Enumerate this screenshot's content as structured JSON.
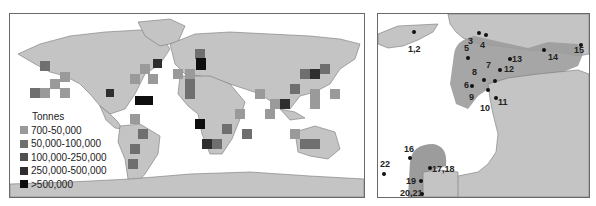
{
  "figure": {
    "left_panel": {
      "name": "world-map",
      "legend": {
        "title": "Tonnes",
        "items": [
          {
            "label": "700-50,000",
            "color": "#9a9a9a"
          },
          {
            "label": "50,000-100,000",
            "color": "#6f6f6f"
          },
          {
            "label": "100,000-250,000",
            "color": "#505050"
          },
          {
            "label": "250,000-500,000",
            "color": "#2e2e2e"
          },
          {
            "label": ">500,000",
            "color": "#0e0e0e"
          }
        ]
      }
    },
    "right_panel": {
      "name": "western-europe-map",
      "sites": [
        {
          "label": "1,2"
        },
        {
          "label": "3"
        },
        {
          "label": "4"
        },
        {
          "label": "5"
        },
        {
          "label": "6"
        },
        {
          "label": "7"
        },
        {
          "label": "8"
        },
        {
          "label": "9"
        },
        {
          "label": "10"
        },
        {
          "label": "11"
        },
        {
          "label": "12"
        },
        {
          "label": "13"
        },
        {
          "label": "14"
        },
        {
          "label": "15"
        },
        {
          "label": "16"
        },
        {
          "label": "17,18"
        },
        {
          "label": "19"
        },
        {
          "label": "20,21"
        },
        {
          "label": "22"
        }
      ]
    }
  },
  "colors": {
    "land": "#c4c4c4",
    "highlight_region": "#9c9c9c",
    "border": "#6a6a6a"
  }
}
